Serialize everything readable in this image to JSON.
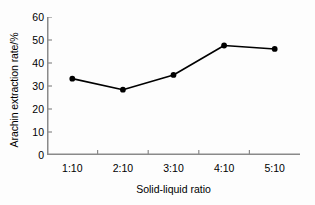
{
  "chart_data": {
    "type": "line",
    "title": "",
    "subtitle": "",
    "xlabel": "Solid-liquid ratio",
    "ylabel": "Arachin extraction rate/%",
    "categories": [
      "1:10",
      "2:10",
      "3:10",
      "4:10",
      "5:10"
    ],
    "values": [
      33.2,
      28.4,
      34.8,
      47.6,
      46.1
    ],
    "series": [
      {
        "name": "Arachin extraction rate",
        "values": [
          33.2,
          28.4,
          34.8,
          47.6,
          46.1
        ]
      }
    ],
    "ylim": [
      0,
      60
    ],
    "ytick_labels": [
      "0",
      "10",
      "20",
      "30",
      "40",
      "50",
      "60"
    ],
    "ytick_values": [
      0,
      10,
      20,
      30,
      40,
      50,
      60
    ],
    "xtick_labels": [
      "1:10",
      "2:10",
      "3:10",
      "4:10",
      "5:10"
    ],
    "grid": false,
    "legend": false,
    "legend_position": "none",
    "marker": "filled-circle",
    "line_color": "#000000",
    "marker_color": "#000000",
    "axis_color": "#808080",
    "background_color": "#fdfdfd"
  }
}
